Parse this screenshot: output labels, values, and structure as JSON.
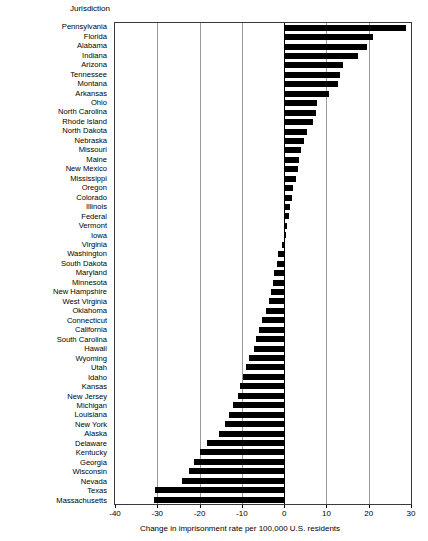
{
  "chart_data": {
    "type": "bar",
    "orientation": "horizontal",
    "title": "",
    "column_header": "Jurisdiction",
    "xlabel": "Change in imprisonment rate per 100,000 U.S. residents",
    "ylabel": "Jurisdiction",
    "xlim": [
      -40,
      30
    ],
    "xticks": [
      -40,
      -30,
      -20,
      -10,
      0,
      10,
      20,
      30
    ],
    "xticklabels": [
      "-40",
      "-30",
      "-20",
      "-10",
      "0",
      "10",
      "20",
      "30"
    ],
    "grid": true,
    "gridlines_x": [
      -40,
      -30,
      -20,
      -10,
      0,
      10,
      20,
      30
    ],
    "zero_line": 0,
    "legend": null,
    "bar_color": "#000000",
    "categories": [
      "Pennsylvania",
      "Florida",
      "Alabama",
      "Indiana",
      "Arizona",
      "Tennessee",
      "Montana",
      "Arkansas",
      "Ohio",
      "North Carolina",
      "Rhode Island",
      "North Dakota",
      "Nebraska",
      "Missouri",
      "Maine",
      "New Mexico",
      "Mississippi",
      "Oregon",
      "Colorado",
      "Illinois",
      "Federal",
      "Vermont",
      "Iowa",
      "Virginia",
      "Washington",
      "South Dakota",
      "Maryland",
      "Minnesota",
      "New Hampshire",
      "West Virginia",
      "Oklahoma",
      "Connecticut",
      "California",
      "South Carolina",
      "Hawaii",
      "Wyoming",
      "Utah",
      "Idaho",
      "Kansas",
      "New Jersey",
      "Michigan",
      "Louisiana",
      "New York",
      "Alaska",
      "Delaware",
      "Kentucky",
      "Georgia",
      "Wisconsin",
      "Nevada",
      "Texas",
      "Massachusetts"
    ],
    "values": [
      28.8,
      21.0,
      19.5,
      17.5,
      14.0,
      13.2,
      12.7,
      10.5,
      7.8,
      7.5,
      6.8,
      5.4,
      4.6,
      4.0,
      3.6,
      3.2,
      2.8,
      2.2,
      1.8,
      1.4,
      1.2,
      0.7,
      0.5,
      -0.5,
      -1.4,
      -1.8,
      -2.3,
      -2.7,
      -3.2,
      -3.6,
      -4.3,
      -5.2,
      -6.0,
      -6.6,
      -7.2,
      -8.3,
      -9.0,
      -9.7,
      -10.4,
      -11.0,
      -12.2,
      -13.0,
      -14.0,
      -15.5,
      -18.3,
      -20.0,
      -21.3,
      -22.5,
      -24.2,
      -30.5,
      -30.7
    ]
  }
}
